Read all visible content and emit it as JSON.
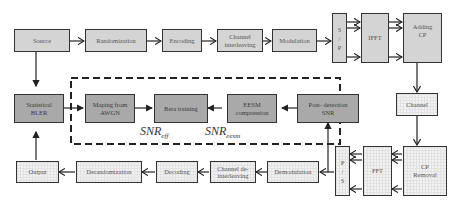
{
  "diagram": {
    "transmitter": {
      "source": "Source",
      "randomization": "Randomization",
      "encoding": "Encoding",
      "channel_interleaving": [
        "Channel",
        "interleaving"
      ],
      "modulation": "Modulation",
      "sp": [
        "S",
        "/",
        "P"
      ],
      "ifft": "IFFT",
      "adding_cp": [
        "Adding",
        "CP"
      ]
    },
    "channel": "Channel",
    "receiver": {
      "cp_removal": [
        "CP",
        "Removal"
      ],
      "fft": "FFT",
      "ps": [
        "P",
        "/",
        "S"
      ],
      "demodulation": "Demodulation",
      "channel_deinterleaving": [
        "Channel de-",
        "interleaving"
      ],
      "decoding": "Decoding",
      "derandomization": "Derandomization",
      "output": "Output"
    },
    "abstraction": {
      "statistical_bler": [
        "Statistical",
        "BLER"
      ],
      "mapping_awgn": [
        "Maping from",
        "AWGN"
      ],
      "beta_training": "Beta training",
      "eesm_compression": [
        "EESM",
        "compression"
      ],
      "post_detection_snr": [
        "Post- detection",
        "SNR"
      ],
      "snr_eff_base": "SNR",
      "snr_eff_sub": "eff",
      "snr_eesm_base": "SNR",
      "snr_eesm_sub": "eesm"
    },
    "colors": {
      "transmitter_fill": "#d4d4d4",
      "abstraction_fill": "#a9a9a9",
      "receiver_fill": "#f2f2f2",
      "border": "#333333"
    }
  }
}
